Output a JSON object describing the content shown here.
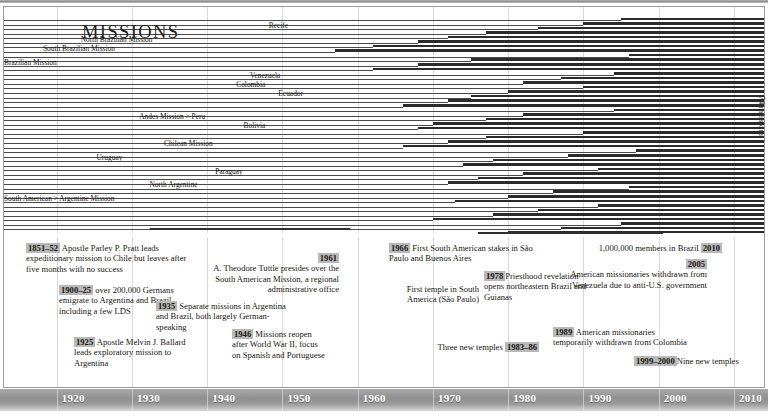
{
  "figure": {
    "title": "MISSIONS",
    "side_label": "74 missions"
  },
  "axis": {
    "ticks": [
      "1920",
      "1930",
      "1940",
      "1950",
      "1960",
      "1970",
      "1980",
      "1990",
      "2000",
      "2010"
    ],
    "min_year": 1913,
    "max_year": 2014
  },
  "missions": [
    {
      "label": "Recife",
      "label_year": 1951,
      "row": 2
    },
    {
      "label": "North Brazilian Mission",
      "label_year": 1933,
      "row": 5
    },
    {
      "label": "South Brazilian Mission",
      "label_year": 1928,
      "row": 7
    },
    {
      "label": "Brazilian Mission",
      "label_year": 1918,
      "row": 10
    },
    {
      "label": "Venezuela",
      "label_year": 1950,
      "row": 13
    },
    {
      "label": "Colombia",
      "label_year": 1948,
      "row": 15
    },
    {
      "label": "Ecuador",
      "label_year": 1953,
      "row": 17
    },
    {
      "label": "Andes Mission > Peru",
      "label_year": 1940,
      "row": 22
    },
    {
      "label": "Bolivia",
      "label_year": 1948,
      "row": 24
    },
    {
      "label": "Chilean Mission",
      "label_year": 1941,
      "row": 28
    },
    {
      "label": "Uruguay",
      "label_year": 1929,
      "row": 31
    },
    {
      "label": "Paraguay",
      "label_year": 1945,
      "row": 34
    },
    {
      "label": "North Argentine",
      "label_year": 1939,
      "row": 37
    },
    {
      "label": "South American > Argentine Mission",
      "label_year": 1920,
      "row": 40
    }
  ],
  "chart_data": {
    "type": "bar",
    "title": "MISSIONS",
    "xlabel": "",
    "ylabel": "74 missions",
    "xlim": [
      1913,
      2014
    ],
    "grid": true,
    "legend": "none",
    "note": "Horizontal span bars: each row is one mission; bar starts at the mission's founding year and runs to the present (2014).",
    "categories": [
      "Recife",
      "Rec-2",
      "Rec-3",
      "Rec-4",
      "North Brazilian Mission",
      "NBM-2",
      "South Brazilian Mission",
      "SBM-2",
      "SBM-3",
      "Brazilian Mission",
      "BM-2",
      "BM-3",
      "Venezuela",
      "Ven-2",
      "Colombia",
      "Col-2",
      "Ecuador",
      "Ecu-2",
      "Ecu-3",
      "Ecu-4",
      "Andes Mission > Peru",
      "Peru-2",
      "Bolivia",
      "Bol-2",
      "Bol-3",
      "Bol-4",
      "Chilean Mission",
      "Chi-2",
      "Chi-3",
      "Uruguay",
      "Uru-2",
      "Uru-3",
      "Paraguay",
      "Par-2",
      "Par-3",
      "North Argentine",
      "NA-2",
      "NA-3",
      "South American > Argentine Mission",
      "SAAM-2",
      "SAAM-3",
      "SAAM-4",
      "SAAM-5",
      "M44",
      "M45",
      "M46",
      "M47",
      "M48",
      "M49",
      "M50"
    ],
    "start_years": [
      1995,
      1990,
      1984,
      1977,
      1972,
      1968,
      1962,
      1957,
      1996,
      1975,
      1968,
      1962,
      1994,
      1987,
      1982,
      1990,
      1980,
      1975,
      1972,
      1966,
      1994,
      1982,
      1977,
      1970,
      1968,
      1990,
      1977,
      1972,
      1966,
      1997,
      1988,
      1978,
      1974,
      1992,
      1982,
      1976,
      1972,
      1996,
      1986,
      1980,
      1973,
      1992,
      1984,
      1978,
      1970,
      1995,
      1987,
      1980,
      1974,
      1990
    ],
    "end_year": 2014,
    "values": [
      19,
      24,
      30,
      37,
      42,
      46,
      52,
      57,
      18,
      39,
      46,
      52,
      20,
      27,
      32,
      24,
      34,
      39,
      42,
      48,
      20,
      32,
      37,
      44,
      46,
      24,
      37,
      42,
      48,
      17,
      26,
      36,
      40,
      22,
      32,
      38,
      42,
      18,
      28,
      34,
      41,
      22,
      30,
      36,
      44,
      19,
      27,
      34,
      40,
      24
    ]
  },
  "annotations": [
    {
      "id": "a1851",
      "year": "1851–52",
      "text": " Apostle Parley P. Pratt leads expeditionary mission to Chile but leaves after five months with no success",
      "align": "left"
    },
    {
      "id": "a1900",
      "year": "1900–25",
      "text": " over 200,000 Germans emigrate to Argentina and Brazil, including a few LDS",
      "align": "left"
    },
    {
      "id": "a1925",
      "year": "1925",
      "text": " Apostle Melvin J. Ballard leads exploratory mission to Argentina",
      "align": "left"
    },
    {
      "id": "a1935",
      "year": "1935",
      "text": " Separate missions in Argentina and Brazil, both largely German-speaking",
      "align": "left"
    },
    {
      "id": "a1946",
      "year": "1946",
      "text": " Missions reopen after World War II, focus on Spanish and Portuguese",
      "align": "left"
    },
    {
      "id": "a1961",
      "year": "1961",
      "text": "A. Theodore Tuttle presides over the South American Mission, a regional administrative office",
      "align": "right"
    },
    {
      "id": "a1966",
      "year": "1966",
      "text": " First South American stakes in São Paulo and Buenos Aires",
      "align": "left"
    },
    {
      "id": "atemple",
      "year": "",
      "text": "First temple in South America (São Paulo)",
      "align": "right"
    },
    {
      "id": "a1978",
      "year": "1978",
      "text": "Priesthood revelation opens northeastern Brazil and Guianas",
      "align": "left"
    },
    {
      "id": "a1983",
      "year": "1983–86",
      "text": "Three new temples",
      "align": "right"
    },
    {
      "id": "a1989",
      "year": "1989",
      "text": " American missionaries temporarily withdrawn from Colombia",
      "align": "left"
    },
    {
      "id": "a2005",
      "year": "2005",
      "text": "American missionaries withdrawn from Venezuela due to anti-U.S. government",
      "align": "right"
    },
    {
      "id": "a1999",
      "year": "1999–2000",
      "text": "Nine new temples",
      "align": "left"
    },
    {
      "id": "a2010",
      "year": "2010",
      "text": "1,000,000 members in Brazil",
      "align": "right"
    }
  ]
}
